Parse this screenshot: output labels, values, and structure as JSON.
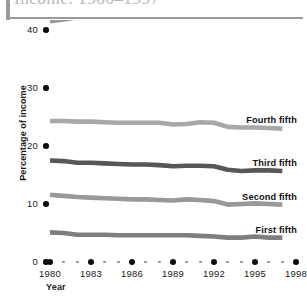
{
  "title": "Income: 1980–1997",
  "axes": {
    "ylabel": "Percentage of income",
    "xlabel": "Year",
    "yticks": [
      "0",
      "10",
      "20",
      "30",
      "40"
    ],
    "xticks": [
      "1980",
      "1983",
      "1986",
      "1989",
      "1992",
      "1995",
      "1998"
    ]
  },
  "series_labels": {
    "highest": "Highest fifth",
    "fourth": "Fourth fifth",
    "third": "Third fifth",
    "second": "Second fifth",
    "first": "First fifth"
  },
  "colors": {
    "highest": "#9a9a9a",
    "fourth": "#a8a8a8",
    "third": "#575757",
    "second": "#999999",
    "first": "#7e7e7e",
    "axis_text": "#1a1a1a",
    "title_text": "#b9b9b9",
    "rule": "#9a9a9a"
  },
  "chart_data": {
    "type": "line",
    "title": "Income: 1980–1997",
    "xlabel": "Year",
    "ylabel": "Percentage of income",
    "ylim": [
      0,
      40
    ],
    "xlim": [
      1980,
      1998
    ],
    "grid": false,
    "legend": "inline-right",
    "x": [
      1980,
      1981,
      1982,
      1983,
      1984,
      1985,
      1986,
      1987,
      1988,
      1989,
      1990,
      1991,
      1992,
      1993,
      1994,
      1995,
      1996,
      1997
    ],
    "series": [
      {
        "name": "Highest fifth",
        "color": "#9a9a9a",
        "values": [
          41.5,
          41.8,
          42.2,
          42.4,
          42.8,
          43.1,
          43.6,
          43.6,
          43.8,
          44.3,
          44.0,
          43.8,
          44.7,
          46.2,
          46.4,
          46.5,
          46.8,
          47.2
        ]
      },
      {
        "name": "Fourth fifth",
        "color": "#a8a8a8",
        "values": [
          24.3,
          24.3,
          24.2,
          24.2,
          24.1,
          24.0,
          24.0,
          24.0,
          24.0,
          23.7,
          23.8,
          24.1,
          24.0,
          23.3,
          23.2,
          23.2,
          23.1,
          23.0
        ]
      },
      {
        "name": "Third fifth",
        "color": "#575757",
        "values": [
          17.5,
          17.4,
          17.1,
          17.1,
          17.0,
          16.9,
          16.8,
          16.8,
          16.7,
          16.5,
          16.6,
          16.6,
          16.5,
          15.9,
          15.7,
          15.8,
          15.8,
          15.7
        ]
      },
      {
        "name": "Second fifth",
        "color": "#999999",
        "values": [
          11.6,
          11.4,
          11.2,
          11.1,
          11.0,
          10.9,
          10.8,
          10.8,
          10.7,
          10.6,
          10.8,
          10.7,
          10.5,
          9.9,
          10.0,
          10.1,
          10.0,
          9.9
        ]
      },
      {
        "name": "First fifth",
        "color": "#7e7e7e",
        "values": [
          5.1,
          5.0,
          4.7,
          4.7,
          4.7,
          4.6,
          4.6,
          4.6,
          4.6,
          4.6,
          4.6,
          4.5,
          4.4,
          4.2,
          4.2,
          4.4,
          4.2,
          4.2
        ]
      }
    ]
  }
}
